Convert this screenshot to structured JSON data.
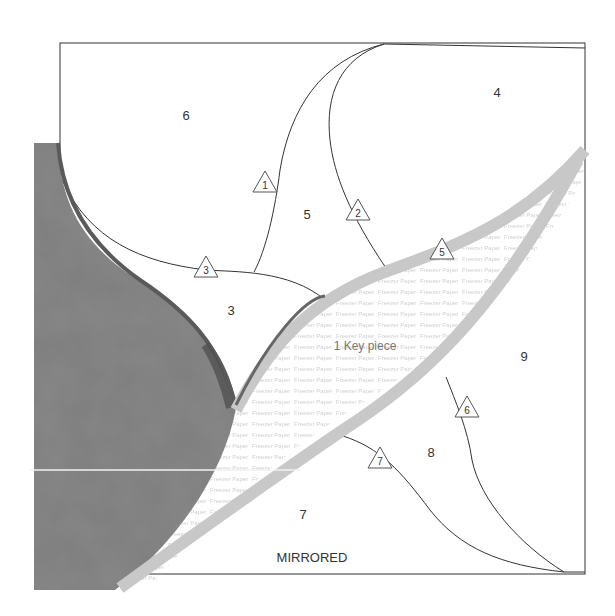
{
  "pattern": {
    "type": "foundation paper piecing template with fabric",
    "border_color": "#333333",
    "fabric_color": "#7a7a7a",
    "strip_color": "#cfcfcf",
    "regions": [
      {
        "id": "region-6-top",
        "label": "6",
        "x": 186,
        "y": 120
      },
      {
        "id": "region-4",
        "label": "4",
        "x": 497,
        "y": 97
      },
      {
        "id": "region-5",
        "label": "5",
        "x": 307,
        "y": 219
      },
      {
        "id": "region-3",
        "label": "3",
        "x": 231,
        "y": 315
      },
      {
        "id": "region-9",
        "label": "9",
        "x": 524,
        "y": 361
      },
      {
        "id": "region-8",
        "label": "8",
        "x": 431,
        "y": 457
      },
      {
        "id": "region-7",
        "label": "7",
        "x": 303,
        "y": 519
      }
    ],
    "triangles": [
      {
        "label": "1",
        "x": 265,
        "y": 183
      },
      {
        "label": "2",
        "x": 358,
        "y": 211
      },
      {
        "label": "3",
        "x": 206,
        "y": 268
      },
      {
        "label": "5",
        "x": 442,
        "y": 250
      },
      {
        "label": "6",
        "x": 467,
        "y": 408
      },
      {
        "label": "7",
        "x": 380,
        "y": 459
      }
    ],
    "key_piece_label": "1 Key piece",
    "mirrored_label": "MIRRORED",
    "watermark_text": "Freezer Paper"
  }
}
